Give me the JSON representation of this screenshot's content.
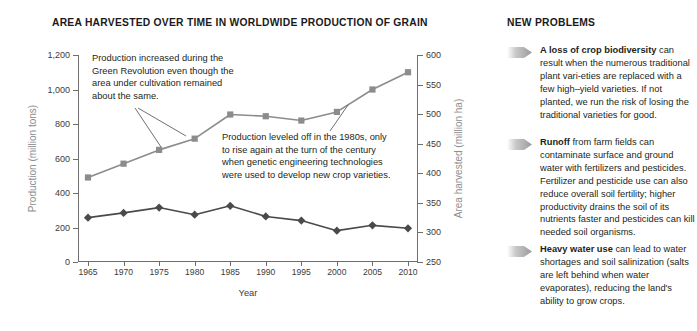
{
  "chart_panel": {
    "title": "AREA HARVESTED OVER TIME IN WORLDWIDE PRODUCTION OF GRAIN",
    "annotations": [
      "Production increased during the Green Revolution even though the area under cultivation remained about the same.",
      "Production leveled off in the 1980s, only to rise again at the turn of the century when genetic engineering technologies were used to develop new crop varieties."
    ]
  },
  "chart_data": {
    "type": "line",
    "title": "AREA HARVESTED OVER TIME IN WORLDWIDE PRODUCTION OF GRAIN",
    "xlabel": "Year",
    "ylabel": "Production (million tons)",
    "y2label": "Area harvested (million ha)",
    "categories": [
      1965,
      1970,
      1975,
      1980,
      1985,
      1990,
      1995,
      2000,
      2005,
      2010
    ],
    "xtick_labels": [
      "1965",
      "1970",
      "1975",
      "1980",
      "1985",
      "1990",
      "1995",
      "2000",
      "2005",
      "2010"
    ],
    "ylim": [
      0,
      1200
    ],
    "yticks": [
      0,
      200,
      400,
      600,
      800,
      1000,
      1200
    ],
    "ytick_labels": [
      "0",
      "200",
      "400",
      "600",
      "800",
      "1,000",
      "1,200"
    ],
    "y2lim": [
      250,
      600
    ],
    "y2ticks": [
      250,
      300,
      350,
      400,
      450,
      500,
      550,
      600
    ],
    "y2tick_labels": [
      "250",
      "300",
      "350",
      "400",
      "450",
      "500",
      "550",
      "600"
    ],
    "grid": false,
    "legend": "none",
    "series": [
      {
        "name": "Production (million tons)",
        "axis": "left",
        "marker": "square",
        "color": "#8c8c8c",
        "values": [
          490,
          570,
          650,
          715,
          855,
          845,
          820,
          870,
          1000,
          1100
        ]
      },
      {
        "name": "Area harvested (million ha)",
        "axis": "right",
        "marker": "diamond",
        "color": "#4a4a4a",
        "values": [
          325,
          333,
          342,
          330,
          345,
          327,
          320,
          303,
          312,
          307
        ]
      }
    ],
    "annotations": [
      "Production increased during the Green Revolution even though the area under cultivation remained about the same.",
      "Production leveled off in the 1980s, only to rise again at the turn of the century when genetic engineering technologies were used to develop new crop varieties."
    ]
  },
  "problems_panel": {
    "title": "NEW PROBLEMS",
    "items": [
      {
        "lead": "A loss of crop biodiversity",
        "body": " can result when the numerous traditional plant vari-eties are replaced with a few high–yield varieties. If not planted, we run the risk of losing the traditional varieties for good."
      },
      {
        "lead": "Runoff",
        "body": " from farm fields can contaminate surface and ground water with fertilizers and pesticides. Fertilizer and pesticide use can also reduce overall soil fertility; higher productivity drains the soil of its nutrients faster and pesticides can kill needed soil organisms."
      },
      {
        "lead": "Heavy water use",
        "body": " can lead to water shortages and soil salinization (salts are left behind when water evaporates), reducing the land's ability to grow crops."
      }
    ]
  },
  "colors": {
    "production_series": "#8c8c8c",
    "area_series": "#4a4a4a",
    "axis": "#6f6f6f",
    "axis_title": "#8e8e8e",
    "arrow_bullet": "#a8a8a8",
    "text": "#231f20"
  }
}
